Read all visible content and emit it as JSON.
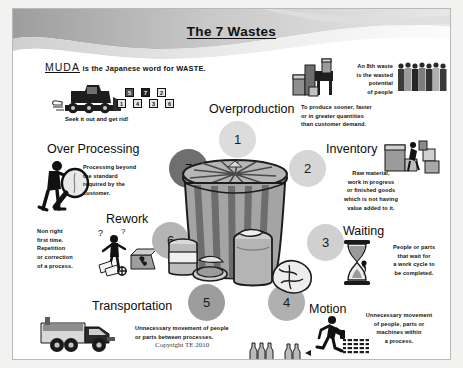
{
  "slide": {
    "title": "The 7 Wastes",
    "copyright": "Copyright TE 2010"
  },
  "muda": {
    "term": "MUDA",
    "sentence": "is the Japanese word for WASTE.",
    "caption": "Seek it out and get rid!",
    "blocks_top": [
      "5",
      "7",
      "2"
    ],
    "blocks_bottom": [
      "1",
      "4",
      "3",
      "6"
    ]
  },
  "eighth_waste": {
    "text": "An 8th waste\nis the wasted\npotential\nof people"
  },
  "wastes": [
    {
      "number": "1",
      "label": "Overproduction",
      "description": "To produce sooner, faster\nor in greater quantities\nthan customer demand."
    },
    {
      "number": "2",
      "label": "Inventory",
      "description": "Raw material,\nwork in progress\nor finished goods\nwhich is not having\nvalue added to it."
    },
    {
      "number": "3",
      "label": "Waiting",
      "description": "People or parts\nthat wait for\na work cycle to\nbe completed."
    },
    {
      "number": "4",
      "label": "Motion",
      "description": "Unnecessary movement\nof people, parts or\nmachines within\na process."
    },
    {
      "number": "5",
      "label": "Transportation",
      "description": "Unnecessary movement of people\nor parts between processes."
    },
    {
      "number": "6",
      "label": "Rework",
      "description": "Non right\nfirst time.\nRepetition\nor correction\nof a process."
    },
    {
      "number": "7",
      "label": "Over Processing",
      "description": "Processing beyond\nthe standard\nrequired by the\ncustomer."
    }
  ],
  "colors": {
    "circle_highlight": "#6b6b6b",
    "circle_mid": "#a8a8a8",
    "circle_light": "#d3d3d3",
    "banner_gray": "#b5b5b5",
    "text": "#111111",
    "page_bg": "#ffffff",
    "frame_bg": "#f2f2f0"
  },
  "icons": {
    "bulldozer": "bulldozer-icon",
    "people_group": "people-group-icon",
    "boxes_stack": "boxes-stack-icon",
    "forklift": "forklift-icon",
    "magnifier_person": "magnifier-person-icon",
    "rework_person": "rework-person-icon",
    "hourglass": "hourglass-icon",
    "truck": "truck-icon",
    "running_person": "running-person-icon",
    "trash_can": "trash-can-icon",
    "bottles": "bottles-icon"
  }
}
